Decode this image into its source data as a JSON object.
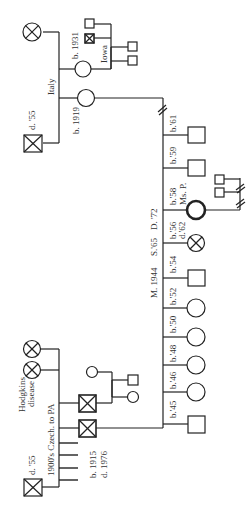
{
  "diagram": {
    "type": "pedigree",
    "orientation": "rotated-90",
    "colors": {
      "line": "#222222",
      "background": "#ffffff",
      "text": "#333333"
    },
    "maternal_side": {
      "origin_label": "Italy",
      "grandmother": {
        "label": "",
        "status": "deceased-affected"
      },
      "grandfather": {
        "label": "d. '55",
        "status": "deceased-affected"
      },
      "aunt": {
        "label": "b. 1931",
        "location_label": "Iowa"
      },
      "aunt_spouse_siblings": [
        "male",
        "male-deceased-affected"
      ],
      "aunt_children": [
        "male",
        "male"
      ],
      "mother": {
        "label": "b. 1919"
      }
    },
    "paternal_side": {
      "origin_label": "1900's Czech. to PA",
      "grandmother_siblings_label": "Hodgkins disease",
      "grandfather": {
        "label": "d. '55",
        "status": "deceased-affected"
      },
      "father": {
        "label_birth": "b. 1915",
        "label_death": "d. 1976",
        "status": "deceased-affected"
      },
      "uncle": {
        "status": "deceased-affected"
      },
      "uncle_children": [
        "female",
        "male",
        "female"
      ],
      "other_siblings_count": 4
    },
    "marriage": {
      "married_label": "M. 1944",
      "separated_label": "S.'65",
      "divorced_label": "D. '72",
      "break_mark": "//"
    },
    "children": [
      {
        "sex": "male",
        "label": "b.'61"
      },
      {
        "sex": "male",
        "label": "b.'59"
      },
      {
        "sex": "female",
        "label": "b.'58",
        "name": "Ms. P.",
        "proband": true
      },
      {
        "sex": "female",
        "label": "b.'56",
        "label2": "d.'62",
        "status": "deceased-affected"
      },
      {
        "sex": "male",
        "label": "b.'54"
      },
      {
        "sex": "female",
        "label": "b.'52"
      },
      {
        "sex": "female",
        "label": "b.'50"
      },
      {
        "sex": "female",
        "label": "b.'48"
      },
      {
        "sex": "female",
        "label": "b.'46"
      },
      {
        "sex": "male",
        "label": "b.'45"
      }
    ],
    "proband_children": [
      "male",
      "male"
    ]
  }
}
